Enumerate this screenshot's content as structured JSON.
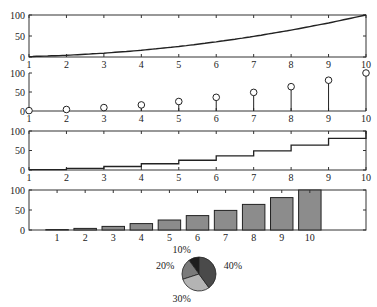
{
  "chart_data": [
    {
      "type": "line",
      "title": "",
      "xlabel": "",
      "ylabel": "",
      "x": [
        1,
        2,
        3,
        4,
        5,
        6,
        7,
        8,
        9,
        10
      ],
      "values": [
        1,
        4,
        9,
        16,
        25,
        36,
        49,
        64,
        81,
        100
      ],
      "xlim": [
        1,
        10
      ],
      "ylim": [
        0,
        100
      ],
      "xticks": [
        "1",
        "2",
        "3",
        "4",
        "5",
        "6",
        "7",
        "8",
        "9",
        "10"
      ],
      "yticks": [
        "0",
        "50",
        "100"
      ],
      "box": true,
      "grid": false
    },
    {
      "type": "stem",
      "title": "",
      "x": [
        1,
        2,
        3,
        4,
        5,
        6,
        7,
        8,
        9,
        10
      ],
      "values": [
        1,
        4,
        9,
        16,
        25,
        36,
        49,
        64,
        81,
        100
      ],
      "xlim": [
        1,
        10
      ],
      "ylim": [
        0,
        100
      ],
      "xticks": [
        "1",
        "2",
        "3",
        "4",
        "5",
        "6",
        "7",
        "8",
        "9",
        "10"
      ],
      "yticks": [
        "0",
        "50",
        "100"
      ],
      "marker": "circle",
      "box": false,
      "grid": false
    },
    {
      "type": "stairs",
      "title": "",
      "x": [
        1,
        2,
        3,
        4,
        5,
        6,
        7,
        8,
        9,
        10
      ],
      "values": [
        1,
        4,
        9,
        16,
        25,
        36,
        49,
        64,
        81,
        100
      ],
      "xlim": [
        1,
        10
      ],
      "ylim": [
        0,
        100
      ],
      "xticks": [
        "1",
        "2",
        "3",
        "4",
        "5",
        "6",
        "7",
        "8",
        "9",
        "10"
      ],
      "yticks": [
        "0",
        "50",
        "100"
      ],
      "box": true,
      "grid": false
    },
    {
      "type": "bar",
      "title": "",
      "categories": [
        "1",
        "2",
        "3",
        "4",
        "5",
        "6",
        "7",
        "8",
        "9",
        "10"
      ],
      "values": [
        1,
        4,
        9,
        16,
        25,
        36,
        49,
        64,
        81,
        100
      ],
      "xlim": [
        0,
        12
      ],
      "ylim": [
        0,
        100
      ],
      "yticks": [
        "0",
        "50",
        "100"
      ],
      "bar_color": "#8c8c8c",
      "box": true,
      "grid": false
    },
    {
      "type": "pie",
      "title": "",
      "labels": [
        "10%",
        "20%",
        "30%",
        "40%"
      ],
      "values": [
        10,
        20,
        30,
        40
      ],
      "colors": [
        "#1e1e1e",
        "#7a7a7a",
        "#b4b4b4",
        "#4a4a4a"
      ]
    }
  ]
}
